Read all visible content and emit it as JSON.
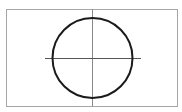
{
  "diagram": {
    "type": "circle-with-crosshair",
    "background": "#ffffff",
    "frame": {
      "x": 6.5,
      "y": 9.5,
      "width": 171,
      "height": 97,
      "stroke": "#a6a6a6",
      "stroke_width": 1
    },
    "vertical_axis": {
      "x": 92.5,
      "y1": 9.5,
      "y2": 106.5,
      "stroke": "#8a8a8a",
      "stroke_width": 1
    },
    "horizontal_axis": {
      "y": 58.5,
      "x1": 45,
      "x2": 141,
      "stroke": "#555555",
      "stroke_width": 1
    },
    "circle": {
      "cx": 92.5,
      "cy": 58,
      "r": 40,
      "stroke": "#1a1a1a",
      "stroke_width": 2
    }
  }
}
